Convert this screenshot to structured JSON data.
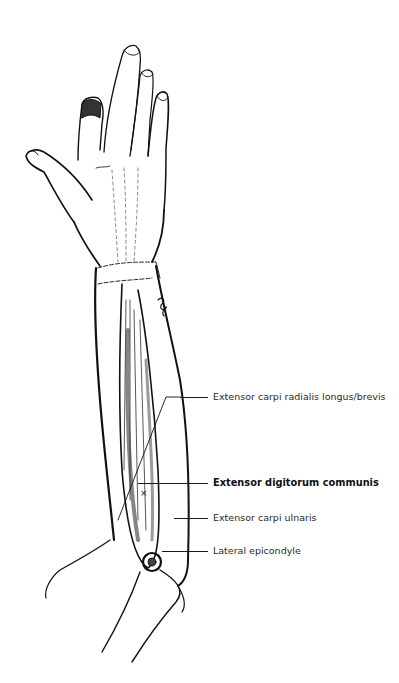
{
  "figure": {
    "marker": "×",
    "labels": [
      {
        "id": "ecr",
        "text": "Extensor carpi radialis longus/brevis",
        "emphasis": false
      },
      {
        "id": "edc",
        "text": "Extensor digitorum communis",
        "emphasis": true
      },
      {
        "id": "ecu",
        "text": "Extensor carpi ulnaris",
        "emphasis": false
      },
      {
        "id": "lat-epi",
        "text": "Lateral epicondyle",
        "emphasis": false
      }
    ]
  }
}
